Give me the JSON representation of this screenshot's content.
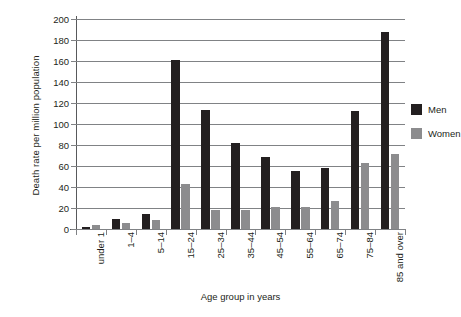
{
  "chart_data": {
    "type": "bar",
    "title": "",
    "xlabel": "Age group in years",
    "ylabel": "Death rate per million population",
    "categories": [
      "under 1",
      "1–4",
      "5–14",
      "15–24",
      "25–34",
      "35–44",
      "45–54",
      "55–64",
      "65–74",
      "75–84",
      "85 and over"
    ],
    "series": [
      {
        "name": "Men",
        "color": "#231f20",
        "values": [
          2,
          10,
          14,
          161,
          113,
          82,
          69,
          55,
          58,
          112,
          188
        ]
      },
      {
        "name": "Women",
        "color": "#8c8c8e",
        "values": [
          4,
          6,
          9,
          43,
          18,
          18,
          21,
          21,
          27,
          63,
          71
        ]
      }
    ],
    "ylim": [
      0,
      200
    ],
    "yticks": [
      0,
      20,
      40,
      60,
      80,
      100,
      120,
      140,
      160,
      180,
      200
    ],
    "ytick_labels": [
      "0",
      "20",
      "40",
      "60",
      "80",
      "100",
      "120",
      "140",
      "160",
      "180",
      "200"
    ],
    "grid": true,
    "legend_position": "right"
  },
  "legend": {
    "items": [
      {
        "label": "Men"
      },
      {
        "label": "Women"
      }
    ]
  }
}
